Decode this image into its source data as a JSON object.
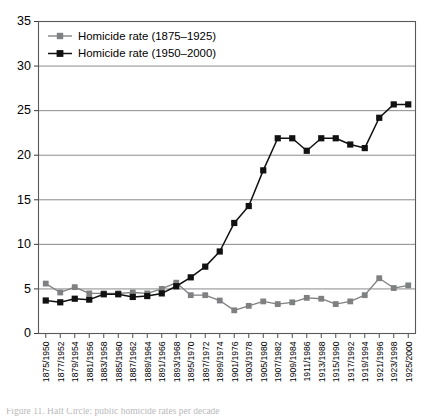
{
  "figure": {
    "caption": "Figure 11. Half Circle: public homicide rates per decade"
  },
  "legend": {
    "position": "top-left-inside",
    "entries": [
      {
        "label": "Homicide rate (1875–1925)",
        "color": "#7f8082",
        "marker": "square"
      },
      {
        "label": "Homicide rate (1950–2000)",
        "color": "#111111",
        "marker": "square"
      }
    ]
  },
  "axes": {
    "y_ticks": [
      "0",
      "5",
      "10",
      "15",
      "20",
      "25",
      "30",
      "35"
    ],
    "x_ticks": [
      "1875/1950",
      "1877/1952",
      "1879/1954",
      "1881/1956",
      "1883/1958",
      "1885/1960",
      "1887/1962",
      "1889/1964",
      "1891/1966",
      "1893/1968",
      "1895/1970",
      "1897/1972",
      "1899/1974",
      "1901/1976",
      "1903/1978",
      "1905/1980",
      "1907/1982",
      "1909/1984",
      "1911/1986",
      "1913/1988",
      "1915/1990",
      "1917/1992",
      "1919/1994",
      "1921/1996",
      "1923/1998",
      "1925/2000"
    ]
  },
  "chart_data": {
    "type": "line",
    "title": "",
    "xlabel": "",
    "ylabel": "",
    "ylim": [
      0,
      35
    ],
    "ytick_step": 5,
    "grid": "horizontal",
    "legend_position": "upper left",
    "categories": [
      "1875/1950",
      "1877/1952",
      "1879/1954",
      "1881/1956",
      "1883/1958",
      "1885/1960",
      "1887/1962",
      "1889/1964",
      "1891/1966",
      "1893/1968",
      "1895/1970",
      "1897/1972",
      "1899/1974",
      "1901/1976",
      "1903/1978",
      "1905/1980",
      "1907/1982",
      "1909/1984",
      "1911/1986",
      "1913/1988",
      "1915/1990",
      "1917/1992",
      "1919/1994",
      "1921/1996",
      "1923/1998",
      "1925/2000"
    ],
    "series": [
      {
        "name": "Homicide rate (1875–1925)",
        "color": "#7f8082",
        "values": [
          5.6,
          4.6,
          5.2,
          4.5,
          4.5,
          4.5,
          4.6,
          4.5,
          5.0,
          5.7,
          4.3,
          4.3,
          3.7,
          2.6,
          3.1,
          3.6,
          3.3,
          3.5,
          4.0,
          3.9,
          3.3,
          3.6,
          4.3,
          6.2,
          5.1,
          5.4
        ]
      },
      {
        "name": "Homicide rate (1950–2000)",
        "color": "#111111",
        "values": [
          3.7,
          3.5,
          3.9,
          3.8,
          4.4,
          4.4,
          4.1,
          4.2,
          4.5,
          5.3,
          6.3,
          7.5,
          9.2,
          12.4,
          14.3,
          18.3,
          21.9,
          21.9,
          20.5,
          21.9,
          21.9,
          21.2,
          20.8,
          24.2,
          25.7,
          25.7
        ]
      }
    ],
    "series_new_extended": {
      "name": "Homicide rate (1950–2000) full",
      "note": "black series spans all 26 x positions",
      "values": [
        3.7,
        3.5,
        3.9,
        3.8,
        4.4,
        4.4,
        4.1,
        4.2,
        4.5,
        5.3,
        6.3,
        7.5,
        9.2,
        12.4,
        14.3,
        18.3,
        21.9,
        21.9,
        20.5,
        21.9,
        21.9,
        21.2,
        20.8,
        24.2,
        25.7,
        25.7
      ]
    },
    "notes": {
      "peak_value": 30.8,
      "peak_category": "1915/1990",
      "min_gray_value": 2.6,
      "final_black_value": 9.0
    }
  },
  "plot_series_full": {
    "gray": [
      5.6,
      4.6,
      5.2,
      4.5,
      4.5,
      4.5,
      4.6,
      4.5,
      5.0,
      5.7,
      4.3,
      4.3,
      3.7,
      2.6,
      3.1,
      3.6,
      3.3,
      3.5,
      4.0,
      3.9,
      3.3,
      3.6,
      4.3,
      6.2,
      5.1,
      5.4
    ],
    "black": [
      3.7,
      3.5,
      3.9,
      3.8,
      4.4,
      4.4,
      4.1,
      4.2,
      4.5,
      5.3,
      6.3,
      7.5,
      9.2,
      12.4,
      14.3,
      18.3,
      21.9,
      21.9,
      20.5,
      21.9,
      21.9,
      21.2,
      20.8,
      24.2,
      25.7,
      25.7
    ]
  }
}
